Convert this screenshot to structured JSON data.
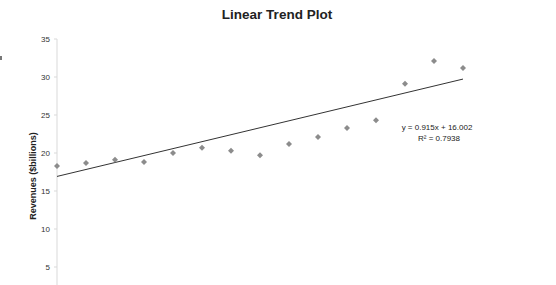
{
  "chart_data": {
    "type": "scatter",
    "title": "Linear Trend Plot",
    "xlabel": "",
    "ylabel": "Revenues ($billions)",
    "ylim": [
      0,
      35
    ],
    "yticks": [
      5,
      10,
      15,
      20,
      25,
      30,
      35
    ],
    "grid": false,
    "legend": null,
    "series": [
      {
        "name": "Revenues",
        "marker": "diamond",
        "color": "#8c8c8c",
        "x": [
          1,
          2,
          3,
          4,
          5,
          6,
          7,
          8,
          9,
          10,
          11,
          12,
          13,
          14,
          15
        ],
        "values": [
          18.3,
          18.7,
          19.1,
          18.8,
          20.0,
          20.7,
          20.3,
          19.7,
          21.2,
          22.1,
          23.3,
          24.3,
          29.1,
          32.1,
          31.2
        ]
      }
    ],
    "trendline": {
      "type": "linear",
      "slope": 0.915,
      "intercept": 16.002,
      "color": "#333333",
      "equation_label": "y = 0.915x + 16.002",
      "r2_label": "R² = 0.7938"
    }
  },
  "page": {
    "title": "Linear Trend Plot",
    "ylabel": "Revenues ($billions)",
    "equation": "y = 0.915x + 16.002",
    "r2": "R² = 0.7938",
    "ytick_labels": [
      "35",
      "30",
      "25",
      "20",
      "15",
      "10",
      "5"
    ]
  }
}
